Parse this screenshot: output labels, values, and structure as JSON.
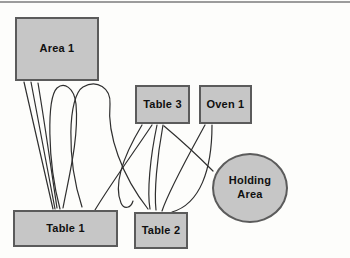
{
  "page": {
    "background": "#fdfdfb",
    "top_rule_color": "#9c9c9c"
  },
  "diagram": {
    "type": "spaghetti-flow-diagram",
    "colors": {
      "node_fill": "#c6c6c6",
      "node_border": "#5b5b5b",
      "edge": "#2f2f2f",
      "text": "#101010"
    },
    "nodes": [
      {
        "id": "area-1",
        "label": "Area 1",
        "shape": "rect"
      },
      {
        "id": "table-3",
        "label": "Table 3",
        "shape": "rect"
      },
      {
        "id": "oven-1",
        "label": "Oven 1",
        "shape": "rect"
      },
      {
        "id": "holding-area",
        "label": "Holding Area",
        "shape": "ellipse"
      },
      {
        "id": "table-1",
        "label": "Table 1",
        "shape": "rect"
      },
      {
        "id": "table-2",
        "label": "Table 2",
        "shape": "rect"
      }
    ],
    "edges": [
      {
        "from": "area-1",
        "to": "table-1",
        "path": "M 24 82 L 53 209"
      },
      {
        "from": "area-1",
        "to": "table-1",
        "path": "M 31 82 L 55 209"
      },
      {
        "from": "area-1",
        "to": "table-1",
        "path": "M 38 83 C 45 125 52 175 57 208"
      },
      {
        "from": "table-1",
        "to": "area-1",
        "path": "M 60 209 C 47 160 47 98 57 88 C 64 82 74 87 76 104 C 79 138 69 176 63 208"
      },
      {
        "from": "table-1",
        "to": "table-2",
        "path": "M 82 207 C 66 158 68 96 83 87 C 97 79 111 88 110 104 C 107 135 122 176 148 209"
      },
      {
        "from": "table-1",
        "to": "table-3",
        "path": "M 95 210 C 112 182 134 152 152 125"
      },
      {
        "from": "table-3",
        "to": "table-1",
        "path": "M 142 125 C 124 155 113 184 121 203 C 124 210 131 208 133 201"
      },
      {
        "from": "table-3",
        "to": "table-2",
        "path": "M 157 125 C 150 158 147 192 150 209"
      },
      {
        "from": "table-2",
        "to": "table-3",
        "path": "M 163 125 C 157 158 154 192 156 210"
      },
      {
        "from": "oven-1",
        "to": "table-2",
        "path": "M 205 125 C 187 158 169 190 162 211"
      },
      {
        "from": "oven-1",
        "to": "table-2",
        "path": "M 212 125 C 212 170 200 204 172 212"
      },
      {
        "from": "table-3",
        "to": "holding-area",
        "path": "M 164 126 C 182 141 199 157 213 171"
      }
    ]
  }
}
